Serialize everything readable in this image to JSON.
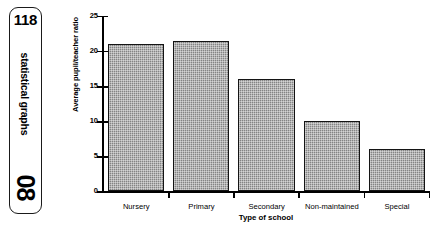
{
  "sidebar": {
    "page_number": "118",
    "section_label": "statistical graphs",
    "chapter_number": "08"
  },
  "chart_data": {
    "type": "bar",
    "title": "",
    "categories": [
      "Nursery",
      "Primary",
      "Secondary",
      "Non-maintained",
      "Special"
    ],
    "values": [
      21,
      21.5,
      16,
      10,
      6
    ],
    "xlabel": "Type of school",
    "ylabel": "Average pupil/teacher ratio",
    "ylim": [
      0,
      25
    ],
    "yticks": [
      0,
      5,
      10,
      15,
      20,
      25
    ],
    "ytick_labels": [
      "0",
      "5",
      "10",
      "15",
      "20",
      "25"
    ],
    "grid": false,
    "legend": false,
    "bar_color": "#848484",
    "bar_edge_color": "#141414",
    "axis_color": "#000000"
  }
}
